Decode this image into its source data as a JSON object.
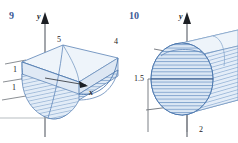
{
  "page": {
    "background": "#ffffff",
    "width": 238,
    "height": 143,
    "label_color": "#3c5a96",
    "surface_fill": "#e8eff7",
    "hatch_color": "#7b9fc8",
    "outline_color": "#4a6f9e",
    "axis_color": "#5a5f66"
  },
  "figures": [
    {
      "number": "9",
      "type": "parabolic-trough-solid",
      "axis_labels": {
        "y": "y",
        "x": "x"
      },
      "ticks": [
        {
          "text": "1",
          "axis": "y",
          "value": 1
        },
        {
          "text": "1",
          "axis": "y",
          "value": 1
        },
        {
          "text": "5",
          "axis": "z",
          "value": 5
        },
        {
          "text": "4",
          "axis": "x",
          "value": 4
        }
      ]
    },
    {
      "number": "10",
      "type": "cylinder-circular-cross-section",
      "axis_labels": {
        "y": "y"
      },
      "ticks": [
        {
          "text": "1.5",
          "axis": "y",
          "value": 1.5
        },
        {
          "text": "2",
          "axis": "x",
          "value": 2
        }
      ]
    }
  ],
  "fig9": {
    "number": "9",
    "y_axis_label": "y",
    "x_axis_label": "x",
    "tick_one_upper": "1",
    "tick_one_lower": "1",
    "tick_five": "5",
    "tick_four": "4"
  },
  "fig10": {
    "number": "10",
    "y_axis_label": "y",
    "tick_one_point_five": "1.5",
    "tick_two": "2"
  }
}
